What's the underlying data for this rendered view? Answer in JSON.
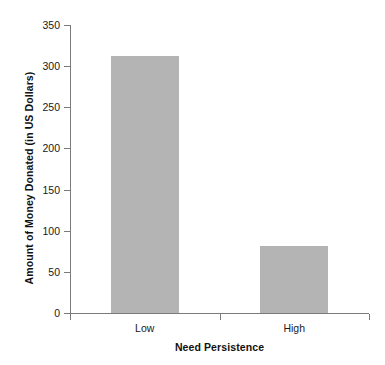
{
  "chart_data": {
    "type": "bar",
    "title": "",
    "subtitle": "",
    "xlabel": "Need Persistence",
    "ylabel": "Amount of Money Donated (in US Dollars)",
    "categories": [
      "Low",
      "High"
    ],
    "values": [
      312,
      81
    ],
    "series": [
      {
        "name": "Amount of Money Donated (in US Dollars)",
        "values": [
          312,
          81
        ]
      }
    ],
    "ylim": [
      0,
      350
    ],
    "y_ticks": [
      0,
      50,
      100,
      150,
      200,
      250,
      300,
      350
    ],
    "y_tick_labels": [
      "0",
      "50",
      "100",
      "150",
      "200",
      "250",
      "300",
      "350"
    ],
    "x_tick_labels": [
      "Low",
      "High"
    ],
    "grid": false,
    "legend": false,
    "legend_position": "none",
    "bar_color": "#b4b4b4",
    "axis_color": "#7a7a7a",
    "text_color": "#1a1a1a",
    "background_color": "#ffffff"
  },
  "axes": {
    "y_title": "Amount of Money Donated (in US Dollars)",
    "x_title": "Need Persistence"
  },
  "ticks": {
    "y": [
      {
        "label": "350",
        "value": 350
      },
      {
        "label": "300",
        "value": 300
      },
      {
        "label": "250",
        "value": 250
      },
      {
        "label": "200",
        "value": 200
      },
      {
        "label": "150",
        "value": 150
      },
      {
        "label": "100",
        "value": 100
      },
      {
        "label": "50",
        "value": 50
      },
      {
        "label": "0",
        "value": 0
      }
    ],
    "x": [
      {
        "label": "Low"
      },
      {
        "label": "High"
      }
    ]
  }
}
